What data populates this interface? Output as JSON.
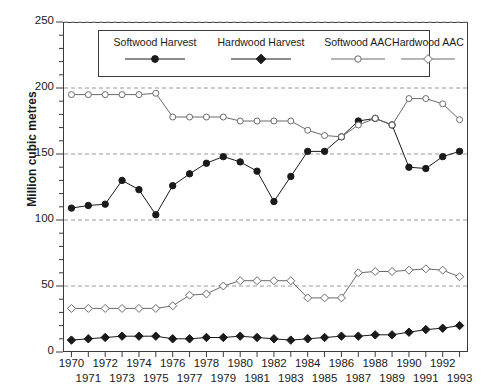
{
  "chart_data": {
    "type": "line",
    "title": "",
    "xlabel": "",
    "ylabel": "Million cubic metres",
    "xlim": [
      1970,
      1993
    ],
    "ylim": [
      0,
      250
    ],
    "yticks": [
      0,
      50,
      100,
      150,
      200,
      250
    ],
    "grid": "horizontal-dashed",
    "legend_position": "top-center-inside",
    "x": [
      1970,
      1971,
      1972,
      1973,
      1974,
      1975,
      1976,
      1977,
      1978,
      1979,
      1980,
      1981,
      1982,
      1983,
      1984,
      1985,
      1986,
      1987,
      1988,
      1989,
      1990,
      1991,
      1992,
      1993
    ],
    "xtick_labels_row1": [
      "1970",
      "1972",
      "1974",
      "1976",
      "1978",
      "1980",
      "1982",
      "1984",
      "1986",
      "1988",
      "1990",
      "1992"
    ],
    "xtick_labels_row2": [
      "1971",
      "1973",
      "1975",
      "1977",
      "1979",
      "1981",
      "1983",
      "1985",
      "1987",
      "1989",
      "1991",
      "1993"
    ],
    "series": [
      {
        "name": "Softwood Harvest",
        "marker": "filled-circle",
        "color": "#1a1a1a",
        "values": [
          109,
          111,
          112,
          130,
          123,
          104,
          126,
          135,
          143,
          148,
          144,
          137,
          114,
          133,
          152,
          152,
          163,
          175,
          177,
          172,
          140,
          139,
          148,
          152
        ]
      },
      {
        "name": "Hardwood Harvest",
        "marker": "filled-diamond",
        "color": "#1a1a1a",
        "values": [
          9,
          10,
          11,
          12,
          12,
          12,
          10,
          10,
          11,
          11,
          12,
          11,
          10,
          9,
          10,
          11,
          12,
          12,
          13,
          13,
          15,
          17,
          18,
          20
        ]
      },
      {
        "name": "Softwood AAC",
        "marker": "open-circle",
        "color": "#6a6a6a",
        "values": [
          195,
          195,
          195,
          195,
          195,
          196,
          178,
          178,
          178,
          178,
          175,
          175,
          175,
          175,
          168,
          164,
          163,
          172,
          177,
          172,
          192,
          192,
          188,
          176
        ]
      },
      {
        "name": "Hardwood AAC",
        "marker": "open-diamond",
        "color": "#6a6a6a",
        "values": [
          33,
          33,
          33,
          33,
          33,
          33,
          35,
          43,
          44,
          50,
          54,
          54,
          54,
          54,
          41,
          41,
          41,
          60,
          61,
          61,
          62,
          63,
          62,
          57
        ]
      }
    ]
  },
  "legend": {
    "items": [
      {
        "label": "Softwood Harvest",
        "marker": "filled-circle"
      },
      {
        "label": "Hardwood Harvest",
        "marker": "filled-diamond"
      },
      {
        "label": "Softwood AAC",
        "marker": "open-circle"
      },
      {
        "label": "Hardwood AAC",
        "marker": "open-diamond"
      }
    ]
  },
  "axes": {
    "y_title": "Million cubic metres",
    "y_tick_labels": [
      "250",
      "200",
      "150",
      "100",
      "50",
      "0"
    ]
  }
}
